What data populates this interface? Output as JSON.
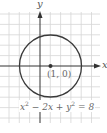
{
  "diagram": {
    "axes": {
      "x_label": "x",
      "y_label": "y"
    },
    "grid": {
      "spacing_units": 1,
      "color": "#d6d6d6"
    },
    "circle": {
      "center": [
        1,
        0
      ],
      "radius": 3,
      "stroke": "#3a3a3a"
    },
    "center_point": {
      "label": "(1, 0)"
    },
    "equation": {
      "base1": "x",
      "exp1": "2",
      "mid": " − 2x + ",
      "base2": "y",
      "exp2": "2",
      "rhs": " = 8"
    }
  }
}
